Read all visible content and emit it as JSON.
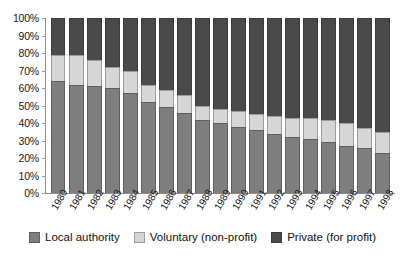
{
  "chart_data": {
    "type": "bar",
    "subtype": "stacked-percent",
    "title": "",
    "xlabel": "",
    "ylabel": "",
    "ylim": [
      0,
      100
    ],
    "yticks": [
      "0%",
      "10%",
      "20%",
      "30%",
      "40%",
      "50%",
      "60%",
      "70%",
      "80%",
      "90%",
      "100%"
    ],
    "grid": false,
    "legend_position": "bottom",
    "categories": [
      "1980",
      "1981",
      "1982",
      "1983",
      "1984",
      "1985",
      "1986",
      "1987",
      "1988",
      "1989",
      "1990",
      "1991",
      "1992",
      "1993",
      "1994",
      "1995",
      "1996",
      "1997",
      "1998"
    ],
    "series": [
      {
        "name": "Local authority",
        "color": "#7e7e7e",
        "values": [
          64,
          62,
          61,
          60,
          57,
          52,
          49,
          46,
          42,
          40,
          38,
          36,
          34,
          32,
          31,
          29,
          27,
          26,
          23
        ]
      },
      {
        "name": "Voluntary (non-profit)",
        "color": "#d6d6d6",
        "values": [
          15,
          17,
          15,
          12,
          13,
          10,
          10,
          10,
          8,
          8,
          9,
          9,
          10,
          11,
          12,
          13,
          13,
          11,
          12
        ]
      },
      {
        "name": "Private (for profit)",
        "color": "#4a4a4a",
        "values": [
          21,
          21,
          24,
          28,
          30,
          38,
          41,
          44,
          50,
          52,
          53,
          55,
          56,
          57,
          57,
          58,
          60,
          63,
          65
        ]
      }
    ]
  },
  "legend": {
    "items": [
      {
        "label": "Local authority",
        "swatch": "local-swatch"
      },
      {
        "label": "Voluntary (non-profit)",
        "swatch": "voluntary-swatch"
      },
      {
        "label": "Private (for profit)",
        "swatch": "private-swatch"
      }
    ]
  }
}
